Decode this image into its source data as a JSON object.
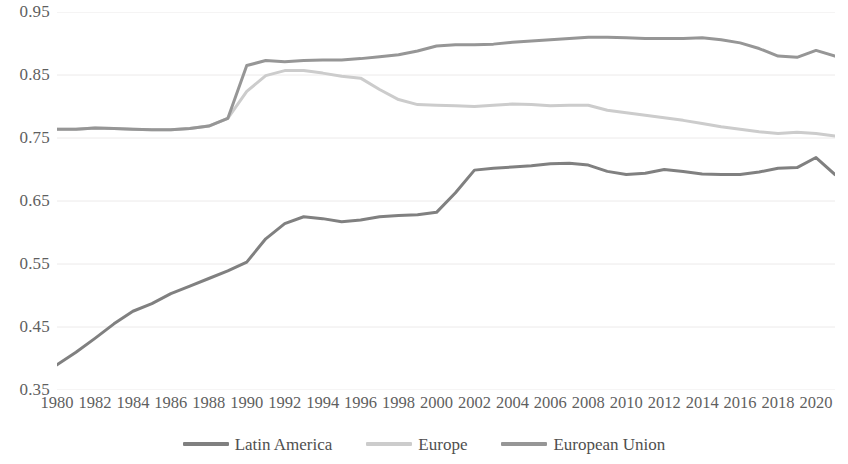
{
  "chart_data": {
    "type": "line",
    "title": "",
    "subtitle": "",
    "xlabel": "",
    "ylabel": "",
    "grid": true,
    "legend_position": "bottom",
    "xlim": [
      1980,
      2021
    ],
    "ylim": [
      0.35,
      0.95
    ],
    "y_ticks": [
      "0.95",
      "0.85",
      "0.75",
      "0.65",
      "0.55",
      "0.45",
      "0.35"
    ],
    "y_tick_values": [
      0.95,
      0.85,
      0.75,
      0.65,
      0.55,
      0.45,
      0.35
    ],
    "x_ticks": [
      "1980",
      "1982",
      "1984",
      "1986",
      "1988",
      "1990",
      "1992",
      "1994",
      "1996",
      "1998",
      "2000",
      "2002",
      "2004",
      "2006",
      "2008",
      "2010",
      "2012",
      "2014",
      "2016",
      "2018",
      "2020"
    ],
    "x_tick_values": [
      1980,
      1982,
      1984,
      1986,
      1988,
      1990,
      1992,
      1994,
      1996,
      1998,
      2000,
      2002,
      2004,
      2006,
      2008,
      2010,
      2012,
      2014,
      2016,
      2018,
      2020
    ],
    "x": [
      1980,
      1981,
      1982,
      1983,
      1984,
      1985,
      1986,
      1987,
      1988,
      1989,
      1990,
      1991,
      1992,
      1993,
      1994,
      1995,
      1996,
      1997,
      1998,
      1999,
      2000,
      2001,
      2002,
      2003,
      2004,
      2005,
      2006,
      2007,
      2008,
      2009,
      2010,
      2011,
      2012,
      2013,
      2014,
      2015,
      2016,
      2017,
      2018,
      2019,
      2020,
      2021
    ],
    "series": [
      {
        "name": "Latin America",
        "color": "#808080",
        "values": [
          0.39,
          0.41,
          0.432,
          0.455,
          0.475,
          0.487,
          0.503,
          0.515,
          0.527,
          0.539,
          0.553,
          0.59,
          0.614,
          0.625,
          0.622,
          0.617,
          0.62,
          0.625,
          0.627,
          0.628,
          0.632,
          0.663,
          0.699,
          0.702,
          0.704,
          0.706,
          0.709,
          0.71,
          0.707,
          0.697,
          0.692,
          0.694,
          0.7,
          0.697,
          0.693,
          0.692,
          0.692,
          0.696,
          0.702,
          0.703,
          0.719,
          0.692
        ]
      },
      {
        "name": "Europe",
        "color": "#cccccc",
        "values": [
          0.764,
          0.764,
          0.766,
          0.765,
          0.764,
          0.763,
          0.763,
          0.765,
          0.769,
          0.781,
          0.824,
          0.849,
          0.857,
          0.857,
          0.853,
          0.848,
          0.845,
          0.827,
          0.811,
          0.803,
          0.802,
          0.801,
          0.8,
          0.802,
          0.804,
          0.803,
          0.801,
          0.802,
          0.802,
          0.794,
          0.79,
          0.786,
          0.782,
          0.778,
          0.773,
          0.768,
          0.764,
          0.76,
          0.757,
          0.759,
          0.757,
          0.753
        ]
      },
      {
        "name": "European Union",
        "color": "#969696",
        "values": [
          0.764,
          0.764,
          0.766,
          0.765,
          0.764,
          0.763,
          0.763,
          0.765,
          0.769,
          0.781,
          0.865,
          0.873,
          0.871,
          0.873,
          0.874,
          0.874,
          0.876,
          0.879,
          0.882,
          0.888,
          0.896,
          0.898,
          0.898,
          0.899,
          0.902,
          0.904,
          0.906,
          0.908,
          0.91,
          0.91,
          0.909,
          0.908,
          0.908,
          0.908,
          0.909,
          0.906,
          0.901,
          0.892,
          0.88,
          0.878,
          0.889,
          0.88
        ]
      }
    ]
  },
  "legend": {
    "items": [
      {
        "label": "Latin America",
        "color": "#808080"
      },
      {
        "label": "Europe",
        "color": "#cccccc"
      },
      {
        "label": "European Union",
        "color": "#969696"
      }
    ]
  },
  "style": {
    "background": "#ffffff",
    "gridline_color": "#eceaea",
    "tick_text_color": "#5f5f5f"
  }
}
